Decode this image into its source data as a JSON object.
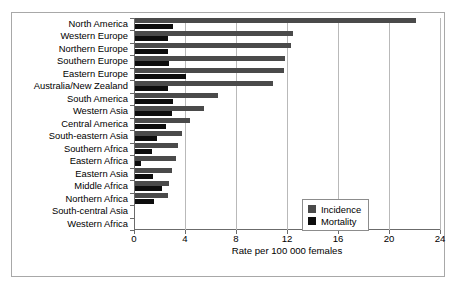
{
  "chart_data": {
    "type": "bar",
    "orientation": "horizontal",
    "title": "",
    "xlabel": "Rate per 100 000 females",
    "ylabel": "",
    "xlim": [
      0,
      24
    ],
    "xticks": [
      0,
      4,
      8,
      12,
      16,
      20,
      24
    ],
    "grid": true,
    "legend_position": "bottom-right",
    "categories": [
      "North America",
      "Western Europe",
      "Northern Europe",
      "Southern Europe",
      "Eastern Europe",
      "Australia/New Zealand",
      "South America",
      "Western Asia",
      "Central America",
      "South-eastern Asia",
      "Southern Africa",
      "Eastern Africa",
      "Eastern Asia",
      "Middle Africa",
      "Northern Africa",
      "South-central Asia",
      "Western Africa"
    ],
    "series": [
      {
        "name": "Incidence",
        "color": "#4a4a4a",
        "values": [
          22.0,
          12.4,
          12.2,
          11.8,
          11.7,
          10.8,
          6.5,
          5.4,
          4.3,
          3.7,
          3.4,
          3.2,
          2.9,
          2.7,
          2.6,
          0.0,
          0.0
        ]
      },
      {
        "name": "Mortality",
        "color": "#0d0d0d",
        "values": [
          3.0,
          2.6,
          2.6,
          2.7,
          4.0,
          2.6,
          3.0,
          2.9,
          2.4,
          1.7,
          1.3,
          0.5,
          1.4,
          2.1,
          1.5,
          0.0,
          0.0
        ]
      }
    ],
    "legend": [
      {
        "label": "Incidence",
        "color": "#4a4a4a"
      },
      {
        "label": "Mortality",
        "color": "#0d0d0d"
      }
    ]
  }
}
